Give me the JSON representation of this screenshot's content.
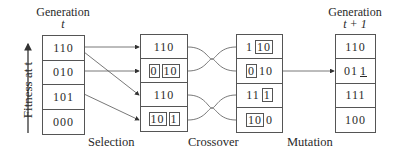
{
  "axis": {
    "label": "Fitness at t"
  },
  "generation_t": {
    "label": "Generation",
    "sub": "t",
    "rows": [
      [
        {
          "text": "110",
          "boxed": false
        }
      ],
      [
        {
          "text": "010",
          "boxed": false
        }
      ],
      [
        {
          "text": "101",
          "boxed": false
        }
      ],
      [
        {
          "text": "000",
          "boxed": false
        }
      ]
    ]
  },
  "after_selection": {
    "rows": [
      [
        {
          "text": "110",
          "boxed": false
        }
      ],
      [
        {
          "text": "0",
          "boxed": true
        },
        {
          "text": "10",
          "boxed": true
        }
      ],
      [
        {
          "text": "110",
          "boxed": false
        }
      ],
      [
        {
          "text": "10",
          "boxed": true
        },
        {
          "text": "1",
          "boxed": true
        }
      ]
    ]
  },
  "after_crossover": {
    "rows": [
      [
        {
          "text": "1",
          "boxed": false
        },
        {
          "text": "10",
          "boxed": true
        }
      ],
      [
        {
          "text": "0",
          "boxed": true
        },
        {
          "text": "10",
          "boxed": false
        }
      ],
      [
        {
          "text": "11",
          "boxed": false
        },
        {
          "text": "1",
          "boxed": true
        }
      ],
      [
        {
          "text": "10",
          "boxed": true
        },
        {
          "text": "0",
          "boxed": false
        }
      ]
    ]
  },
  "generation_t1": {
    "label": "Generation",
    "sub": "t + 1",
    "rows": [
      [
        {
          "text": "110",
          "boxed": false
        }
      ],
      [
        {
          "text": "01",
          "boxed": false
        },
        {
          "text": "1",
          "boxed": false,
          "underline": true
        }
      ],
      [
        {
          "text": "111",
          "boxed": false
        }
      ],
      [
        {
          "text": "100",
          "boxed": false
        }
      ]
    ]
  },
  "steps": {
    "selection": "Selection",
    "crossover": "Crossover",
    "mutation": "Mutation"
  }
}
